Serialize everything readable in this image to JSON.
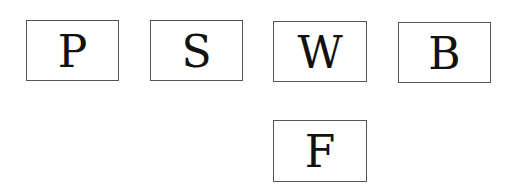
{
  "diagram": {
    "boxes": [
      {
        "label": "P"
      },
      {
        "label": "S"
      },
      {
        "label": "W"
      },
      {
        "label": "B"
      },
      {
        "label": "F"
      }
    ]
  }
}
